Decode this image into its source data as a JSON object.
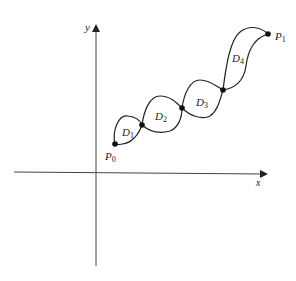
{
  "diagram": {
    "axes": {
      "x_label": "x",
      "y_label": "y"
    },
    "endpoints": {
      "start": "P",
      "start_sub": "0",
      "end": "P",
      "end_sub": "1"
    },
    "regions": [
      {
        "name": "D",
        "sub": "1"
      },
      {
        "name": "D",
        "sub": "2"
      },
      {
        "name": "D",
        "sub": "3"
      },
      {
        "name": "D",
        "sub": "4"
      }
    ],
    "colors": {
      "stroke": "#222222",
      "axis": "#555555"
    }
  }
}
